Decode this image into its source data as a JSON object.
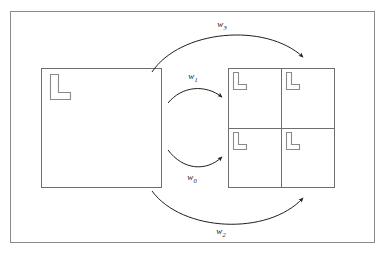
{
  "figure": {
    "title": "",
    "background_color": "#ffffff",
    "line_color": "#4a4a4a",
    "shape_stroke_color": "#777777",
    "glyph_stroke_color": "#888888",
    "frame": {
      "name": "outer-border",
      "x": 10,
      "y": 11,
      "width": 365,
      "height": 232
    },
    "source_block": {
      "label": "",
      "x": 41,
      "y": 68,
      "width": 121,
      "height": 120,
      "glyph": "L"
    },
    "target_grid": {
      "label": "",
      "x": 228,
      "y": 68,
      "width": 107,
      "height": 120,
      "rows": 2,
      "cols": 2,
      "quadrants": [
        {
          "name": "quadrant-top-left",
          "glyph": "L"
        },
        {
          "name": "quadrant-top-right",
          "glyph": "L"
        },
        {
          "name": "quadrant-bottom-left",
          "glyph": "L"
        },
        {
          "name": "quadrant-bottom-right",
          "glyph": "L"
        }
      ]
    },
    "arrows": [
      {
        "name": "arrow-w3",
        "label_base": "w",
        "label_sub": "3",
        "label_x": 222,
        "label_y": 27,
        "path": "M 152,72 C 180,30 265,22 303,57",
        "description": "top arc from source block to top-right of grid"
      },
      {
        "name": "arrow-w1",
        "label_base": "w",
        "label_sub": "1",
        "label_x": 193,
        "label_y": 79,
        "path": "M 168,103 C 182,86 205,84 222,97",
        "description": "upper inner arc from source block to grid upper-left"
      },
      {
        "name": "arrow-w0",
        "label_base": "w",
        "label_sub": "0",
        "label_x": 192,
        "label_y": 180,
        "path": "M 168,150 C 183,170 206,172 222,157",
        "description": "lower inner arc from source block to grid lower-left"
      },
      {
        "name": "arrow-w2",
        "label_base": "w",
        "label_sub": "2",
        "label_x": 221,
        "label_y": 234,
        "path": "M 152,191 C 182,232 268,236 303,198",
        "description": "bottom arc from source block to bottom-right of grid"
      }
    ]
  }
}
